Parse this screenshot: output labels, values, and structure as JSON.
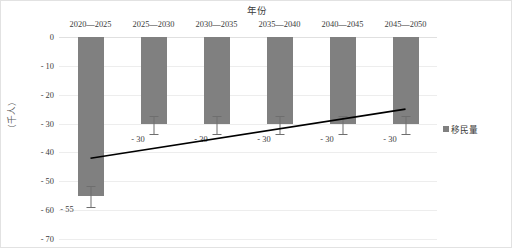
{
  "chart_data": {
    "type": "bar",
    "title": "年份",
    "xlabel": "年份",
    "ylabel": "（千人）",
    "categories": [
      "2020—2025",
      "2025—2030",
      "2030—2035",
      "2035—2040",
      "2040—2045",
      "2045—2050"
    ],
    "values": [
      -55,
      -30,
      -30,
      -30,
      -30,
      -30
    ],
    "data_labels": [
      "- 55",
      "- 30",
      "- 30",
      "- 30",
      "- 30",
      "- 30"
    ],
    "error_low": [
      -59,
      -33.5,
      -33.5,
      -33.5,
      -33.5,
      -33.5
    ],
    "error_high": [
      -51.5,
      -27.5,
      -27.5,
      -27.5,
      -27.5,
      -27.5
    ],
    "ylim": [
      -70,
      0
    ],
    "yticks": [
      0,
      -10,
      -20,
      -30,
      -40,
      -50,
      -60,
      -70
    ],
    "ytick_labels": [
      "0",
      "- 10",
      "- 20",
      "- 30",
      "- 40",
      "- 50",
      "- 60",
      "- 70"
    ],
    "grid": true,
    "legend_position": "right",
    "series": [
      {
        "name": "移民量",
        "type": "bar",
        "color": "#808080",
        "values": [
          -55,
          -30,
          -30,
          -30,
          -30,
          -30
        ]
      },
      {
        "name": "trend",
        "type": "line",
        "color": "#000000",
        "x": [
          0.5,
          5.5
        ],
        "values": [
          -42,
          -25
        ]
      }
    ],
    "legend": [
      "移民量"
    ],
    "bar_color": "#808080",
    "trend_color": "#000000",
    "grid_color": "#ededed"
  }
}
